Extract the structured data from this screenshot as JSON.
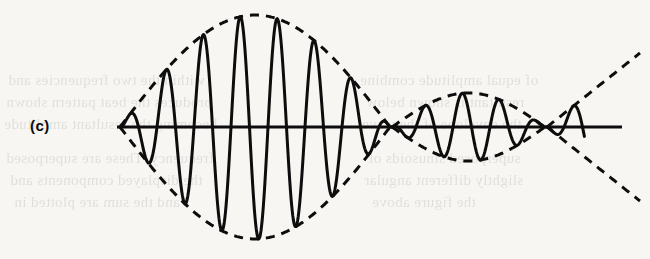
{
  "figure": {
    "panel_label": "(c)",
    "caption_visible": false,
    "ink_color": "#0d0d0d",
    "paper_color": "#f7f6f3",
    "bleed_text_color": "#6f6a62"
  },
  "background_bleedthrough": {
    "note": "faint mirrored text showing through from the reverse side of the page",
    "lines": [
      {
        "text": "within the two frequencies and",
        "x": 8,
        "y": 72
      },
      {
        "text": "produces the beat pattern shown",
        "x": 6,
        "y": 94
      },
      {
        "text": "becoming the resultant amplitude",
        "x": 4,
        "y": 116
      },
      {
        "text": "frequency. These are superposed",
        "x": 6,
        "y": 150
      },
      {
        "text": "the displayed components and",
        "x": 10,
        "y": 172
      },
      {
        "text": "and the sum are plotted in",
        "x": 14,
        "y": 194
      },
      {
        "text": "of equal amplitude combine",
        "x": 360,
        "y": 72
      },
      {
        "text": "resultant is shown below",
        "x": 366,
        "y": 94
      },
      {
        "text": "the envelope of the wave",
        "x": 362,
        "y": 116
      },
      {
        "text": "superposed sinusoids of",
        "x": 368,
        "y": 150
      },
      {
        "text": "slightly different angular",
        "x": 364,
        "y": 172
      },
      {
        "text": "the figure above",
        "x": 372,
        "y": 194
      }
    ]
  },
  "chart_data": {
    "type": "line",
    "title": "",
    "subtitle": "",
    "xlabel": "",
    "ylabel": "",
    "grid": false,
    "legend_position": "none",
    "axis": {
      "baseline_y": 127,
      "x_start": 117,
      "x_end": 622,
      "stroke_width": 3.2
    },
    "xlim": [
      117,
      640
    ],
    "ylim": [
      8,
      244
    ],
    "series": [
      {
        "name": "carrier-waveform",
        "style": "solid",
        "stroke": "#0d0d0d",
        "stroke_width": 3.0,
        "description": "amplitude-modulated carrier oscillation",
        "carrier_period_px": 37.0,
        "carrier_phase_deg": 0
      },
      {
        "name": "upper-envelope",
        "style": "dashed",
        "stroke": "#0d0d0d",
        "stroke_width": 3.0,
        "dash_pattern": "9 7",
        "description": "dashed modulation envelope, upper branch"
      },
      {
        "name": "lower-envelope",
        "style": "dashed",
        "stroke": "#0d0d0d",
        "stroke_width": 3.0,
        "dash_pattern": "9 7",
        "description": "dashed modulation envelope, lower branch, mirror of upper"
      }
    ],
    "envelope_nodes_x": [
      120,
      390,
      545
    ],
    "envelope_lobes": [
      {
        "index": 1,
        "x_start": 120,
        "x_end": 390,
        "peak_x": 258,
        "peak_amplitude": 112
      },
      {
        "index": 2,
        "x_start": 392,
        "x_end": 545,
        "peak_x": 468,
        "peak_amplitude": 34
      },
      {
        "index": 3,
        "x_start": 547,
        "x_end": 640,
        "peak_x": 640,
        "peak_amplitude": 74,
        "note": "diverging open branch at right edge"
      }
    ],
    "carrier_peaks": [
      {
        "x": 135,
        "y": 77,
        "amplitude": 50,
        "polarity": "positive"
      },
      {
        "x": 172,
        "y": 200,
        "amplitude": 73,
        "polarity": "negative"
      },
      {
        "x": 206,
        "y": 40,
        "amplitude": 87,
        "polarity": "positive"
      },
      {
        "x": 240,
        "y": 232,
        "amplitude": 105,
        "polarity": "negative"
      },
      {
        "x": 265,
        "y": 17,
        "amplitude": 110,
        "polarity": "positive"
      },
      {
        "x": 296,
        "y": 234,
        "amplitude": 107,
        "polarity": "negative"
      },
      {
        "x": 323,
        "y": 57,
        "amplitude": 70,
        "polarity": "positive"
      },
      {
        "x": 348,
        "y": 192,
        "amplitude": 65,
        "polarity": "negative"
      },
      {
        "x": 367,
        "y": 107,
        "amplitude": 20,
        "polarity": "positive"
      },
      {
        "x": 381,
        "y": 140,
        "amplitude": 13,
        "polarity": "negative"
      },
      {
        "x": 396,
        "y": 112,
        "amplitude": 15,
        "polarity": "positive"
      },
      {
        "x": 412,
        "y": 150,
        "amplitude": 23,
        "polarity": "negative"
      },
      {
        "x": 432,
        "y": 95,
        "amplitude": 32,
        "polarity": "positive"
      },
      {
        "x": 452,
        "y": 160,
        "amplitude": 33,
        "polarity": "negative"
      },
      {
        "x": 470,
        "y": 98,
        "amplitude": 29,
        "polarity": "positive"
      },
      {
        "x": 490,
        "y": 152,
        "amplitude": 25,
        "polarity": "negative"
      },
      {
        "x": 508,
        "y": 110,
        "amplitude": 17,
        "polarity": "positive"
      },
      {
        "x": 528,
        "y": 140,
        "amplitude": 13,
        "polarity": "negative"
      },
      {
        "x": 547,
        "y": 122,
        "amplitude": 5,
        "polarity": "positive"
      },
      {
        "x": 566,
        "y": 157,
        "amplitude": 30,
        "polarity": "negative"
      }
    ],
    "annotations": [
      {
        "text": "(c)",
        "x": 30,
        "y": 131,
        "role": "panel-label"
      }
    ]
  }
}
